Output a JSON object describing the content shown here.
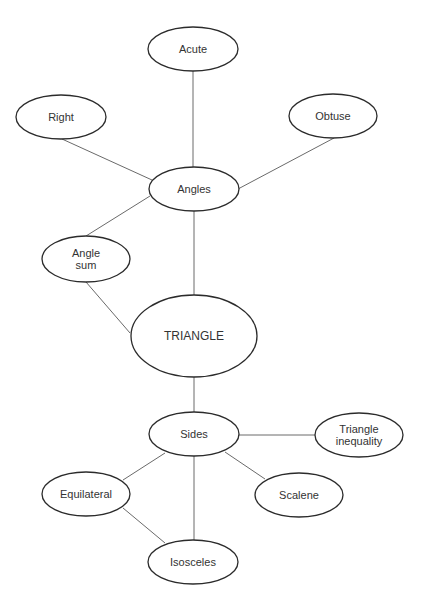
{
  "diagram": {
    "type": "concept-map",
    "central_node": "TRIANGLE",
    "nodes": [
      {
        "id": "acute",
        "label": [
          "Acute"
        ],
        "cx": 193,
        "cy": 49,
        "rx": 45,
        "ry": 22
      },
      {
        "id": "right",
        "label": [
          "Right"
        ],
        "cx": 61,
        "cy": 117,
        "rx": 45,
        "ry": 22
      },
      {
        "id": "obtuse",
        "label": [
          "Obtuse"
        ],
        "cx": 333,
        "cy": 116,
        "rx": 44,
        "ry": 22
      },
      {
        "id": "angles",
        "label": [
          "Angles"
        ],
        "cx": 194,
        "cy": 189,
        "rx": 45,
        "ry": 22
      },
      {
        "id": "angle-sum",
        "label": [
          "Angle",
          "sum"
        ],
        "cx": 86,
        "cy": 259,
        "rx": 44,
        "ry": 23
      },
      {
        "id": "triangle",
        "label": [
          "TRIANGLE"
        ],
        "cx": 194,
        "cy": 336,
        "rx": 63,
        "ry": 41,
        "big": true
      },
      {
        "id": "sides",
        "label": [
          "Sides"
        ],
        "cx": 194,
        "cy": 434,
        "rx": 45,
        "ry": 22
      },
      {
        "id": "triangle-inequality",
        "label": [
          "Triangle",
          "inequality"
        ],
        "cx": 359,
        "cy": 435,
        "rx": 44,
        "ry": 22
      },
      {
        "id": "equilateral",
        "label": [
          "Equilateral"
        ],
        "cx": 86,
        "cy": 494,
        "rx": 44,
        "ry": 22
      },
      {
        "id": "scalene",
        "label": [
          "Scalene"
        ],
        "cx": 299,
        "cy": 495,
        "rx": 44,
        "ry": 22
      },
      {
        "id": "isosceles",
        "label": [
          "Isosceles"
        ],
        "cx": 193,
        "cy": 562,
        "rx": 45,
        "ry": 22
      }
    ],
    "edges": [
      {
        "from": "acute",
        "to": "angles",
        "x1": 193,
        "y1": 71,
        "x2": 193,
        "y2": 167
      },
      {
        "from": "right",
        "to": "angles",
        "x1": 62,
        "y1": 139,
        "x2": 152,
        "y2": 180
      },
      {
        "from": "obtuse",
        "to": "angles",
        "x1": 334,
        "y1": 138,
        "x2": 238,
        "y2": 189
      },
      {
        "from": "angles",
        "to": "angle-sum",
        "x1": 150,
        "y1": 196,
        "x2": 86,
        "y2": 236
      },
      {
        "from": "angles",
        "to": "triangle",
        "x1": 194,
        "y1": 211,
        "x2": 194,
        "y2": 295
      },
      {
        "from": "angle-sum",
        "to": "triangle",
        "x1": 86,
        "y1": 282,
        "x2": 130,
        "y2": 333
      },
      {
        "from": "triangle",
        "to": "sides",
        "x1": 194,
        "y1": 377,
        "x2": 194,
        "y2": 412
      },
      {
        "from": "sides",
        "to": "triangle-inequality",
        "x1": 239,
        "y1": 435,
        "x2": 315,
        "y2": 435
      },
      {
        "from": "sides",
        "to": "equilateral",
        "x1": 165,
        "y1": 453,
        "x2": 123,
        "y2": 480
      },
      {
        "from": "sides",
        "to": "scalene",
        "x1": 225,
        "y1": 452,
        "x2": 265,
        "y2": 479
      },
      {
        "from": "sides",
        "to": "isosceles",
        "x1": 194,
        "y1": 456,
        "x2": 194,
        "y2": 540
      },
      {
        "from": "equilateral",
        "to": "isosceles",
        "x1": 123,
        "y1": 508,
        "x2": 165,
        "y2": 543
      }
    ]
  }
}
